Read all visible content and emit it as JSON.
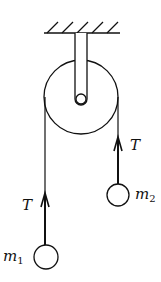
{
  "diagram": {
    "type": "atwood-machine",
    "background": "#ffffff",
    "stroke_color": "#111111",
    "ceiling": {
      "hatch_count": 5
    },
    "pulley": {
      "label": ""
    },
    "left_mass": {
      "label": "m",
      "subscript": "1"
    },
    "right_mass": {
      "label": "m",
      "subscript": "2"
    },
    "left_tension": {
      "label": "T"
    },
    "right_tension": {
      "label": "T"
    }
  }
}
